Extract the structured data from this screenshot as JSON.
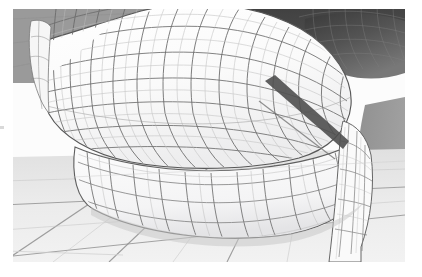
{
  "figure": {
    "kind": "3d-wireframe-render",
    "caption": "",
    "margins": {
      "left": 13,
      "top": 9,
      "right": 17,
      "bottom": 15
    },
    "canvas": {
      "width": 392,
      "height": 253
    }
  },
  "palette": {
    "page_background": "#ffffff",
    "backdrop_gray": "#9a9a9a",
    "backdrop_gray_right": "#9c9c9c",
    "shadow_dark": "#4a4a4a",
    "shadow_dark_soft": "#5e5e5e",
    "upper_body_light": "#fbfbfb",
    "upper_body_shade": "#ececed",
    "sole_light": "#f7f7f7",
    "sole_shade": "#e6e6e7",
    "ground_plane": "#ececec",
    "ground_plane_far": "#e2e2e2",
    "wire_line": "#6b6b6b",
    "wire_line_soft": "#9d9d9d",
    "wire_line_faint": "#bfbfbf",
    "silhouette_edge": "#4f4f4f"
  },
  "scene": {
    "layers": [
      {
        "name": "backdrop-upper-left",
        "fill": "#9a9a9a"
      },
      {
        "name": "backdrop-right",
        "fill": "#9c9c9c"
      },
      {
        "name": "shadow-band-top",
        "fill": "#4a4a4a"
      },
      {
        "name": "ground-plane",
        "fill": "#ececec"
      },
      {
        "name": "sole-band",
        "fill": "#f7f7f7"
      },
      {
        "name": "upper-body",
        "fill": "#fbfbfb"
      }
    ]
  },
  "chart_data": {
    "type": "scatter",
    "title": "",
    "xlabel": "",
    "ylabel": "",
    "note": "Not a data chart — this is a 3D mesh rendering; no numeric series are plotted.",
    "categories": [],
    "values": []
  }
}
